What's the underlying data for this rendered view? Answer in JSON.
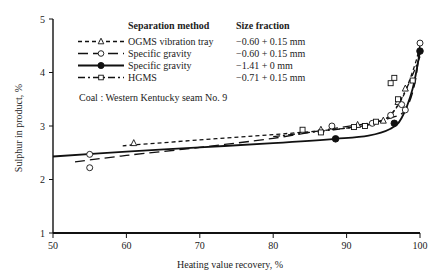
{
  "chart_data": {
    "type": "line",
    "title": "",
    "xlabel": "Heating value recovery, %",
    "ylabel": "Sulphur in product, %",
    "xlim": [
      50,
      100
    ],
    "ylim": [
      1,
      5
    ],
    "xticks": [
      50,
      60,
      70,
      80,
      90,
      100
    ],
    "yticks": [
      1,
      2,
      3,
      4,
      5
    ],
    "grid": false,
    "legend": {
      "position": "upper-left-inside",
      "header_method": "Separation method",
      "header_size": "Size fraction",
      "entries": [
        {
          "method": "OGMS vibration tray",
          "size": "−0.60 + 0.15 mm",
          "line": "short-dash",
          "marker": "open-triangle"
        },
        {
          "method": "Specific gravity",
          "size": "−0.60 + 0.15 mm",
          "line": "long-dash",
          "marker": "open-circle"
        },
        {
          "method": "Specific gravity",
          "size": "−1.41 + 0 mm",
          "line": "solid",
          "marker": "filled-circle"
        },
        {
          "method": "HGMS",
          "size": "−0.71 + 0.15 mm",
          "line": "dash-dot",
          "marker": "open-square"
        }
      ]
    },
    "annotation": "Coal : Western Kentucky seam No. 9",
    "series": [
      {
        "name": "OGMS vibration tray (−0.60 + 0.15 mm)",
        "points": [
          [
            61,
            2.68
          ],
          [
            86.5,
            2.93
          ],
          [
            91.5,
            3.02
          ],
          [
            95,
            3.1
          ],
          [
            97,
            3.45
          ],
          [
            98,
            3.7
          ]
        ],
        "curve": [
          [
            59.5,
            2.63
          ],
          [
            70,
            2.74
          ],
          [
            80,
            2.84
          ],
          [
            88,
            2.93
          ],
          [
            93,
            3.02
          ],
          [
            95.5,
            3.15
          ],
          [
            97.5,
            3.5
          ],
          [
            99.2,
            4.1
          ],
          [
            100,
            4.5
          ]
        ]
      },
      {
        "name": "Specific gravity (−0.60 + 0.15 mm)",
        "points": [
          [
            55,
            2.47
          ],
          [
            55,
            2.22
          ],
          [
            88,
            3.0
          ],
          [
            93.5,
            3.05
          ],
          [
            96,
            3.2
          ],
          [
            97.5,
            3.4
          ],
          [
            98,
            3.3
          ],
          [
            100,
            4.55
          ]
        ],
        "curve": [
          [
            53,
            2.33
          ],
          [
            60,
            2.45
          ],
          [
            70,
            2.6
          ],
          [
            80,
            2.77
          ],
          [
            88,
            2.95
          ],
          [
            93,
            3.05
          ],
          [
            96,
            3.15
          ],
          [
            98,
            3.3
          ],
          [
            99.3,
            3.8
          ],
          [
            100,
            4.55
          ]
        ]
      },
      {
        "name": "Specific gravity (−1.41 + 0 mm)",
        "points": [
          [
            88.5,
            2.76
          ],
          [
            96.5,
            3.05
          ],
          [
            100,
            4.4
          ]
        ],
        "curve": [
          [
            50,
            2.43
          ],
          [
            60,
            2.52
          ],
          [
            70,
            2.6
          ],
          [
            80,
            2.68
          ],
          [
            88.5,
            2.76
          ],
          [
            93,
            2.82
          ],
          [
            96,
            2.95
          ],
          [
            97.5,
            3.15
          ],
          [
            99,
            3.7
          ],
          [
            100,
            4.4
          ]
        ]
      },
      {
        "name": "HGMS (−0.71 + 0.15 mm)",
        "points": [
          [
            84,
            2.93
          ],
          [
            86.5,
            2.88
          ],
          [
            91,
            2.98
          ],
          [
            92.5,
            3.0
          ],
          [
            94,
            3.08
          ],
          [
            96,
            3.8
          ],
          [
            96.5,
            3.9
          ],
          [
            99,
            3.85
          ],
          [
            97,
            3.5
          ]
        ],
        "curve": [
          [
            80,
            2.8
          ],
          [
            85,
            2.88
          ],
          [
            90,
            2.96
          ],
          [
            93,
            3.03
          ],
          [
            95.5,
            3.15
          ],
          [
            97,
            3.4
          ],
          [
            98.5,
            3.8
          ],
          [
            100,
            4.3
          ]
        ]
      }
    ]
  }
}
